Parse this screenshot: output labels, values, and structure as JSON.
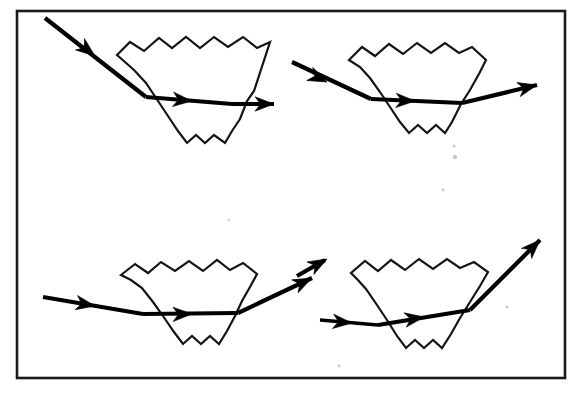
{
  "figure": {
    "kind": "ray-diagram",
    "frame": {
      "x": 17,
      "y": 11,
      "width": 548,
      "height": 367,
      "stroke_color": "#1a1a1a",
      "stroke_width": 2.6,
      "fill_color": "#ffffff"
    },
    "colors": {
      "background": "#ffffff",
      "ink": "#000000",
      "outline": "#141414",
      "frame": "#1a1a1a"
    },
    "panels": [
      {
        "id": "panel-top-left",
        "label": "top-left",
        "prism": {
          "top_surface": "wavy",
          "bottom_surface": "wavy",
          "outline_points": "117,55 130,42 144,51 159,38 172,48 186,37 200,48 214,37 228,47 243,37 257,48 270,42 254,91 247,101 240,119 232,131 225,143 214,135 205,143 196,135 187,143 178,131 166,113 154,95 146,83 134,70"
        },
        "rays": [
          {
            "name": "incident-ray",
            "direction": "down-right",
            "start": [
              45,
              18
            ],
            "end": [
              146,
              97
            ],
            "mid_arrow_at": [
              95,
              56
            ],
            "mid_arrow_angle": 38
          },
          {
            "name": "internal-ray",
            "direction": "right-slightly-down",
            "start": [
              146,
              97
            ],
            "end": [
              232,
              104
            ],
            "mid_arrow_at": [
              192,
              101
            ],
            "mid_arrow_angle": 5
          },
          {
            "name": "exit-ray",
            "direction": "right",
            "start": [
              232,
              104
            ],
            "end": [
              274,
              104
            ],
            "end_arrow_angle": 0
          }
        ]
      },
      {
        "id": "panel-top-right",
        "label": "top-right",
        "prism": {
          "top_surface": "wavy",
          "bottom_surface": "wavy",
          "outline_points": "349,60 362,47 375,56 389,44 403,54 417,43 431,53 445,43 459,53 472,47 486,60 480,72 470,90 461,104 452,122 445,133 436,125 427,133 418,125 409,133 400,122 390,107 380,92 370,78 360,67"
        },
        "rays": [
          {
            "name": "incident-ray",
            "direction": "down-right",
            "start": [
              292,
              62
            ],
            "end": [
              371,
              99
            ],
            "mid_arrow_at": [
              327,
              82
            ],
            "mid_arrow_angle": 25
          },
          {
            "name": "internal-ray",
            "direction": "right-slightly-up",
            "start": [
              371,
              99
            ],
            "end": [
              462,
              103
            ],
            "mid_arrow_at": [
              415,
              101
            ],
            "mid_arrow_angle": 2
          },
          {
            "name": "exit-ray",
            "direction": "right-up",
            "start": [
              462,
              103
            ],
            "end": [
              537,
              85
            ],
            "end_arrow_angle": -14
          }
        ]
      },
      {
        "id": "panel-bottom-left",
        "label": "bottom-left",
        "prism": {
          "top_surface": "wavy",
          "bottom_surface": "wavy",
          "outline_points": "121,275 135,264 148,273 161,262 175,271 189,261 203,271 217,260 230,270 243,263 257,274 250,287 242,301 235,316 227,331 219,344 210,336 201,344 192,336 183,344 174,332 163,316 153,302 142,288 131,280"
        },
        "rays": [
          {
            "name": "incident-ray",
            "direction": "right-slightly-down",
            "start": [
              43,
              297
            ],
            "end": [
              143,
              314
            ],
            "mid_arrow_at": [
              95,
              306
            ],
            "mid_arrow_angle": 10
          },
          {
            "name": "internal-ray",
            "direction": "right-slightly-up",
            "start": [
              143,
              314
            ],
            "end": [
              238,
              313
            ],
            "mid_arrow_at": [
              192,
              314
            ],
            "mid_arrow_angle": -1
          },
          {
            "name": "exit-ray",
            "direction": "right-up",
            "start": [
              238,
              313
            ],
            "end": [
              312,
              278
            ],
            "end_arrow_angle": -26
          }
        ]
      },
      {
        "id": "panel-bottom-right",
        "label": "bottom-right",
        "prism": {
          "top_surface": "wavy",
          "bottom_surface": "wavy",
          "outline_points": "351,273 365,261 378,271 391,260 405,270 419,259 433,269 447,259 460,268 474,262 488,272 480,286 470,302 460,318 451,334 442,348 433,340 424,348 415,340 406,348 397,336 387,320 377,305 366,289 357,279"
        },
        "rays": [
          {
            "name": "clipped-incident-arrow",
            "direction": "right-up",
            "start": [
              297,
              276
            ],
            "end": [
              327,
              259
            ],
            "end_arrow_angle": -29
          },
          {
            "name": "incident-ray",
            "direction": "right-slightly-down",
            "start": [
              320,
              320
            ],
            "end": [
              378,
              325
            ],
            "mid_arrow_at": [
              352,
              323
            ],
            "mid_arrow_angle": 5
          },
          {
            "name": "internal-ray",
            "direction": "right-up",
            "start": [
              378,
              325
            ],
            "end": [
              470,
              310
            ],
            "mid_arrow_at": [
              424,
              317
            ],
            "mid_arrow_angle": -9
          },
          {
            "name": "exit-ray",
            "direction": "right-up-steep",
            "start": [
              470,
              310
            ],
            "end": [
              540,
              240
            ],
            "end_arrow_angle": -45
          }
        ]
      }
    ],
    "specks": [
      {
        "x": 455,
        "y": 157,
        "r": 2.2
      },
      {
        "x": 454,
        "y": 146,
        "r": 1.6
      },
      {
        "x": 443,
        "y": 190,
        "r": 1.4
      },
      {
        "x": 507,
        "y": 307,
        "r": 1.6
      },
      {
        "x": 339,
        "y": 366,
        "r": 1.4
      },
      {
        "x": 229,
        "y": 220,
        "r": 1.2
      }
    ]
  }
}
